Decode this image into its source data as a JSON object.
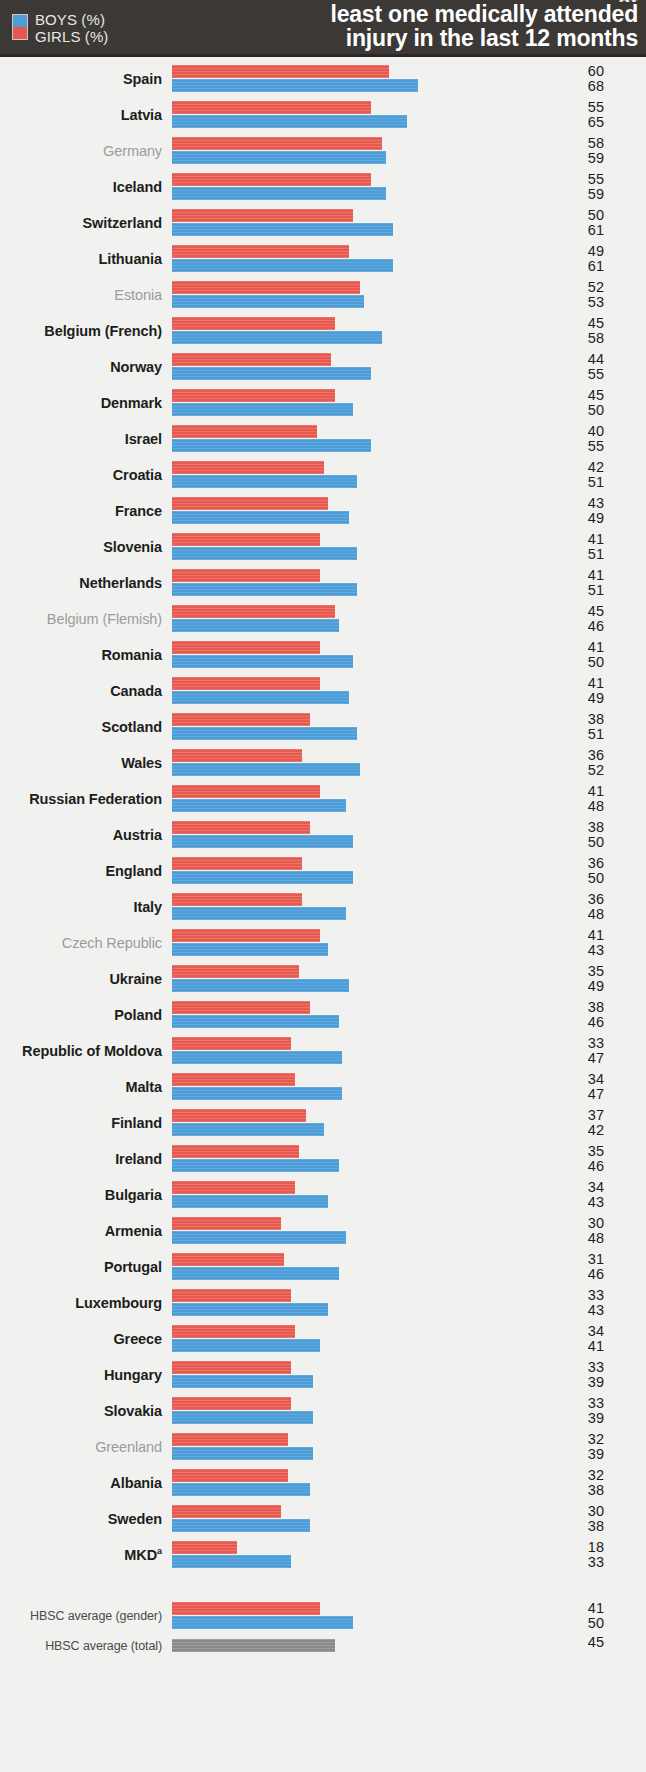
{
  "header": {
    "title_line1": "at",
    "title_line2": "least one medically attended",
    "title_line3": "injury in the last 12 months",
    "legend": {
      "boys_label": "BOYS (%)",
      "girls_label": "GIRLS (%)",
      "boys_color": "#4d9ed8",
      "girls_color": "#e4584f"
    }
  },
  "chart_data": {
    "type": "bar",
    "orientation": "horizontal",
    "title": "at least one medically attended injury in the last 12 months",
    "xlabel": "",
    "ylabel": "",
    "xlim": [
      0,
      70
    ],
    "grid": false,
    "legend_position": "top-left",
    "value_order": [
      "girls",
      "boys"
    ],
    "categories": [
      "Spain",
      "Latvia",
      "Germany",
      "Iceland",
      "Switzerland",
      "Lithuania",
      "Estonia",
      "Belgium (French)",
      "Norway",
      "Denmark",
      "Israel",
      "Croatia",
      "France",
      "Slovenia",
      "Netherlands",
      "Belgium (Flemish)",
      "Romania",
      "Canada",
      "Scotland",
      "Wales",
      "Russian Federation",
      "Austria",
      "England",
      "Italy",
      "Czech Republic",
      "Ukraine",
      "Poland",
      "Republic of Moldova",
      "Malta",
      "Finland",
      "Ireland",
      "Bulgaria",
      "Armenia",
      "Portugal",
      "Luxembourg",
      "Greece",
      "Hungary",
      "Slovakia",
      "Greenland",
      "Albania",
      "Sweden",
      "MKD"
    ],
    "series": [
      {
        "name": "GIRLS (%)",
        "color": "#e8594f",
        "values": [
          60,
          55,
          58,
          55,
          50,
          49,
          52,
          45,
          44,
          45,
          40,
          42,
          43,
          41,
          41,
          45,
          41,
          41,
          38,
          36,
          41,
          38,
          36,
          36,
          41,
          35,
          38,
          33,
          34,
          37,
          35,
          34,
          30,
          31,
          33,
          34,
          33,
          33,
          32,
          32,
          30,
          18
        ]
      },
      {
        "name": "BOYS (%)",
        "color": "#4c9dd8",
        "values": [
          68,
          65,
          59,
          59,
          61,
          61,
          53,
          58,
          55,
          50,
          55,
          51,
          49,
          51,
          51,
          46,
          50,
          49,
          51,
          52,
          48,
          50,
          50,
          48,
          43,
          49,
          46,
          47,
          47,
          42,
          46,
          43,
          48,
          46,
          43,
          41,
          39,
          39,
          39,
          38,
          38,
          33
        ]
      }
    ],
    "averages": {
      "gender": {
        "label": "HBSC average (gender)",
        "girls": 41,
        "boys": 50
      },
      "total": {
        "label": "HBSC average (total)",
        "value": 45,
        "color": "#8a8a8a"
      }
    }
  },
  "rows": [
    {
      "name": "Spain",
      "muted": false,
      "girls": 60,
      "boys": 68
    },
    {
      "name": "Latvia",
      "muted": false,
      "girls": 55,
      "boys": 65
    },
    {
      "name": "Germany",
      "muted": true,
      "girls": 58,
      "boys": 59
    },
    {
      "name": "Iceland",
      "muted": false,
      "girls": 55,
      "boys": 59
    },
    {
      "name": "Switzerland",
      "muted": false,
      "girls": 50,
      "boys": 61
    },
    {
      "name": "Lithuania",
      "muted": false,
      "girls": 49,
      "boys": 61
    },
    {
      "name": "Estonia",
      "muted": true,
      "girls": 52,
      "boys": 53
    },
    {
      "name": "Belgium (French)",
      "muted": false,
      "girls": 45,
      "boys": 58
    },
    {
      "name": "Norway",
      "muted": false,
      "girls": 44,
      "boys": 55
    },
    {
      "name": "Denmark",
      "muted": false,
      "girls": 45,
      "boys": 50
    },
    {
      "name": "Israel",
      "muted": false,
      "girls": 40,
      "boys": 55
    },
    {
      "name": "Croatia",
      "muted": false,
      "girls": 42,
      "boys": 51
    },
    {
      "name": "France",
      "muted": false,
      "girls": 43,
      "boys": 49
    },
    {
      "name": "Slovenia",
      "muted": false,
      "girls": 41,
      "boys": 51
    },
    {
      "name": "Netherlands",
      "muted": false,
      "girls": 41,
      "boys": 51
    },
    {
      "name": "Belgium (Flemish)",
      "muted": true,
      "girls": 45,
      "boys": 46
    },
    {
      "name": "Romania",
      "muted": false,
      "girls": 41,
      "boys": 50
    },
    {
      "name": "Canada",
      "muted": false,
      "girls": 41,
      "boys": 49
    },
    {
      "name": "Scotland",
      "muted": false,
      "girls": 38,
      "boys": 51
    },
    {
      "name": "Wales",
      "muted": false,
      "girls": 36,
      "boys": 52
    },
    {
      "name": "Russian Federation",
      "muted": false,
      "girls": 41,
      "boys": 48
    },
    {
      "name": "Austria",
      "muted": false,
      "girls": 38,
      "boys": 50
    },
    {
      "name": "England",
      "muted": false,
      "girls": 36,
      "boys": 50
    },
    {
      "name": "Italy",
      "muted": false,
      "girls": 36,
      "boys": 48
    },
    {
      "name": "Czech Republic",
      "muted": true,
      "girls": 41,
      "boys": 43
    },
    {
      "name": "Ukraine",
      "muted": false,
      "girls": 35,
      "boys": 49
    },
    {
      "name": "Poland",
      "muted": false,
      "girls": 38,
      "boys": 46
    },
    {
      "name": "Republic of Moldova",
      "muted": false,
      "girls": 33,
      "boys": 47
    },
    {
      "name": "Malta",
      "muted": false,
      "girls": 34,
      "boys": 47
    },
    {
      "name": "Finland",
      "muted": false,
      "girls": 37,
      "boys": 42
    },
    {
      "name": "Ireland",
      "muted": false,
      "girls": 35,
      "boys": 46
    },
    {
      "name": "Bulgaria",
      "muted": false,
      "girls": 34,
      "boys": 43
    },
    {
      "name": "Armenia",
      "muted": false,
      "girls": 30,
      "boys": 48
    },
    {
      "name": "Portugal",
      "muted": false,
      "girls": 31,
      "boys": 46
    },
    {
      "name": "Luxembourg",
      "muted": false,
      "girls": 33,
      "boys": 43
    },
    {
      "name": "Greece",
      "muted": false,
      "girls": 34,
      "boys": 41
    },
    {
      "name": "Hungary",
      "muted": false,
      "girls": 33,
      "boys": 39
    },
    {
      "name": "Slovakia",
      "muted": false,
      "girls": 33,
      "boys": 39
    },
    {
      "name": "Greenland",
      "muted": true,
      "girls": 32,
      "boys": 39
    },
    {
      "name": "Albania",
      "muted": false,
      "girls": 32,
      "boys": 38
    },
    {
      "name": "Sweden",
      "muted": false,
      "girls": 30,
      "boys": 38
    },
    {
      "name": "MKD",
      "muted": false,
      "superscript": "a",
      "girls": 18,
      "boys": 33
    }
  ],
  "averages": {
    "gender_label": "HBSC average (gender)",
    "gender_girls": 41,
    "gender_boys": 50,
    "total_label": "HBSC average (total)",
    "total_value": 45
  }
}
